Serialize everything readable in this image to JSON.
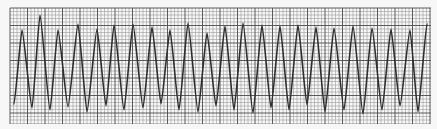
{
  "image": {
    "description": "ECG rhythm strip on grid paper showing a continuous sinusoidal waveform",
    "paper_color": "#f7f7f7",
    "grid_minor_color": "#9a9a9a",
    "grid_major_color": "#4a4a4a",
    "trace_color": "#2e2e2e"
  },
  "grid": {
    "left": 10,
    "top": 8,
    "right": 431,
    "bottom": 124,
    "minor_step": 3.5,
    "major_every": 5
  },
  "waveform": {
    "peaks": [
      {
        "x": 22,
        "y": 30
      },
      {
        "x": 40,
        "y": 15
      },
      {
        "x": 58,
        "y": 30
      },
      {
        "x": 78,
        "y": 24
      },
      {
        "x": 97,
        "y": 29
      },
      {
        "x": 114,
        "y": 25
      },
      {
        "x": 133,
        "y": 24
      },
      {
        "x": 152,
        "y": 27
      },
      {
        "x": 170,
        "y": 30
      },
      {
        "x": 188,
        "y": 23
      },
      {
        "x": 207,
        "y": 33
      },
      {
        "x": 225,
        "y": 26
      },
      {
        "x": 243,
        "y": 23
      },
      {
        "x": 262,
        "y": 25
      },
      {
        "x": 280,
        "y": 26
      },
      {
        "x": 298,
        "y": 25
      },
      {
        "x": 316,
        "y": 27
      },
      {
        "x": 334,
        "y": 28
      },
      {
        "x": 353,
        "y": 26
      },
      {
        "x": 372,
        "y": 28
      },
      {
        "x": 391,
        "y": 29
      },
      {
        "x": 410,
        "y": 30
      },
      {
        "x": 427,
        "y": 24
      }
    ],
    "troughs": [
      {
        "x": 14,
        "y": 104
      },
      {
        "x": 32,
        "y": 108
      },
      {
        "x": 50,
        "y": 110
      },
      {
        "x": 68,
        "y": 107
      },
      {
        "x": 87,
        "y": 112
      },
      {
        "x": 106,
        "y": 106
      },
      {
        "x": 124,
        "y": 110
      },
      {
        "x": 143,
        "y": 108
      },
      {
        "x": 161,
        "y": 104
      },
      {
        "x": 179,
        "y": 110
      },
      {
        "x": 198,
        "y": 112
      },
      {
        "x": 216,
        "y": 106
      },
      {
        "x": 234,
        "y": 110
      },
      {
        "x": 253,
        "y": 113
      },
      {
        "x": 271,
        "y": 108
      },
      {
        "x": 289,
        "y": 110
      },
      {
        "x": 307,
        "y": 105
      },
      {
        "x": 325,
        "y": 112
      },
      {
        "x": 344,
        "y": 110
      },
      {
        "x": 363,
        "y": 114
      },
      {
        "x": 382,
        "y": 110
      },
      {
        "x": 400,
        "y": 106
      },
      {
        "x": 418,
        "y": 112
      }
    ]
  }
}
